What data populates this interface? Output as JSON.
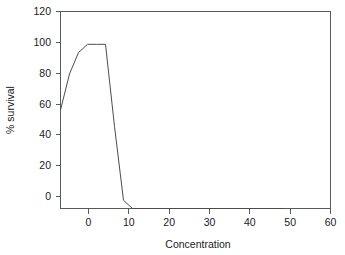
{
  "chart_data": {
    "type": "line",
    "title": "",
    "subtitle": "",
    "xlabel": "Concentration",
    "ylabel": "% survival",
    "xlim": [
      0,
      60
    ],
    "ylim": [
      0,
      120
    ],
    "xticks": [
      0,
      10,
      20,
      30,
      40,
      50,
      60
    ],
    "yticks": [
      0,
      20,
      40,
      60,
      80,
      100,
      120
    ],
    "xtick_labels": [
      "0",
      "10",
      "20",
      "30",
      "40",
      "50",
      "60"
    ],
    "ytick_labels": [
      "0",
      "20",
      "40",
      "60",
      "80",
      "100",
      "120"
    ],
    "grid": false,
    "legend": false,
    "legend_position": "none",
    "line_color": "#4d4d4d",
    "frame_color": "#5a5a5a",
    "background_color": "#ffffff",
    "markers": false,
    "series": [
      {
        "name": "% survival",
        "x": [
          0,
          2,
          4,
          6,
          8,
          10,
          12,
          14,
          16,
          20,
          30,
          40,
          50
        ],
        "values": [
          60,
          82,
          95,
          100,
          100,
          100,
          50,
          5,
          0,
          0,
          0,
          0,
          0
        ]
      }
    ]
  },
  "axes": {
    "x_title": "Concentration",
    "y_title": "% survival"
  }
}
